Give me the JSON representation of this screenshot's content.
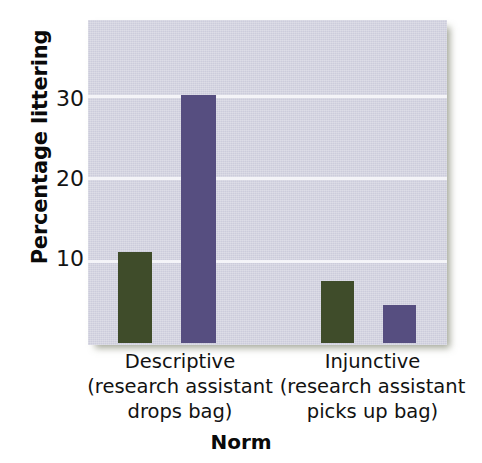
{
  "chart_data": {
    "type": "bar",
    "title": "",
    "xlabel": "Norm",
    "ylabel": "Percentage littering",
    "ylim": [
      0,
      39
    ],
    "yticks": [
      10,
      20,
      30
    ],
    "ytick_labels": [
      "10",
      "20",
      "30"
    ],
    "grid": true,
    "legend": "none",
    "categories": [
      "Descriptive (research assistant drops bag)",
      "Injunctive (research assistant picks up bag)"
    ],
    "category_lines": [
      [
        "Descriptive",
        "(research assistant",
        "drops bag)"
      ],
      [
        "Injunctive",
        "(research assistant",
        "picks up bag)"
      ]
    ],
    "series": [
      {
        "name": "green-condition",
        "color": "#3f4c2a",
        "values": [
          11,
          7.5
        ]
      },
      {
        "name": "purple-condition",
        "color": "#564e80",
        "values": [
          30,
          4.6
        ]
      }
    ],
    "bars": [
      {
        "group": 0,
        "series": 0,
        "value": 11,
        "color": "#3f4c2a"
      },
      {
        "group": 0,
        "series": 1,
        "value": 30,
        "color": "#564e80"
      },
      {
        "group": 1,
        "series": 0,
        "value": 7.5,
        "color": "#3f4c2a"
      },
      {
        "group": 1,
        "series": 1,
        "value": 4.6,
        "color": "#564e80"
      }
    ]
  },
  "axes": {
    "y_title": "Percentage littering",
    "x_title": "Norm",
    "y_tick_30": "30",
    "y_tick_20": "20",
    "y_tick_10": "10"
  },
  "categories": {
    "left": {
      "line1": "Descriptive",
      "line2": "(research assistant",
      "line3": "drops bag)"
    },
    "right": {
      "line1": "Injunctive",
      "line2": "(research assistant",
      "line3": "picks up bag)"
    }
  },
  "colors": {
    "panel_background": "#ccccdb",
    "gridline": "#f4f4f8",
    "bar_green": "#3f4c2a",
    "bar_purple": "#564e80",
    "text": "#121212",
    "page_background": "#ffffff"
  }
}
